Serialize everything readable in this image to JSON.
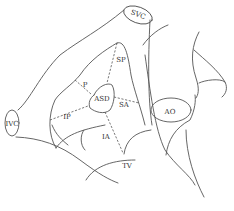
{
  "diagram": {
    "stroke_color": "#555555",
    "label_color": "#333333",
    "labels": {
      "svc": "SVC",
      "ivc": "IVC",
      "sp": "SP",
      "p": "P",
      "asd": "ASD",
      "sa": "SA",
      "ip": "IP",
      "ia": "IA",
      "tv": "TV",
      "ao": "AO"
    }
  }
}
